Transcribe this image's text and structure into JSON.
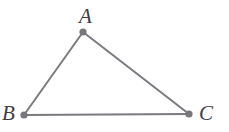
{
  "figure": {
    "name": "triangle-abc",
    "canvas": {
      "width": 229,
      "height": 132,
      "background": "#ffffff"
    },
    "style": {
      "line_color": "#7a7a80",
      "line_width": 2,
      "vertex_dot_color": "#76767c",
      "vertex_dot_radius": 3.6,
      "label_color": "#3d3d42"
    },
    "vertices": [
      {
        "id": "A",
        "label": "A",
        "x": 83,
        "y": 32,
        "label_x": 88,
        "label_y": 17
      },
      {
        "id": "B",
        "label": "B",
        "x": 24,
        "y": 115,
        "label_x": 11,
        "label_y": 114
      },
      {
        "id": "C",
        "label": "C",
        "x": 189,
        "y": 114,
        "label_x": 208,
        "label_y": 114
      }
    ],
    "edges": [
      {
        "id": "AB",
        "from": "A",
        "to": "B"
      },
      {
        "id": "AC",
        "from": "A",
        "to": "C"
      },
      {
        "id": "BC",
        "from": "B",
        "to": "C"
      }
    ],
    "polygon_points": "83,32 24,115 189,114"
  }
}
